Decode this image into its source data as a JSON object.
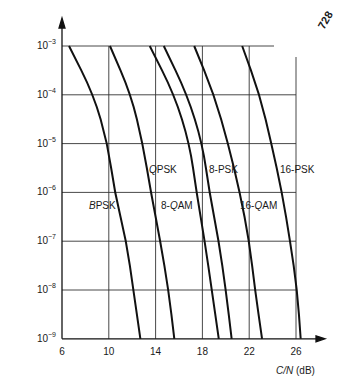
{
  "page_number": "728",
  "chart_data": {
    "type": "line",
    "title": "",
    "xlabel": "C/N (dB)",
    "ylabel": "Probability of error,  theoretical bit error rate",
    "x_scale": "linear",
    "y_scale": "log",
    "xlim": [
      6,
      28
    ],
    "ylim": [
      1e-09,
      0.001
    ],
    "x_ticks": [
      "6",
      "10",
      "14",
      "18",
      "22",
      "26"
    ],
    "y_ticks": [
      "10^-3",
      "10^-4",
      "10^-5",
      "10^-6",
      "10^-7",
      "10^-8",
      "10^-9"
    ],
    "grid": true,
    "legend": "inline labels",
    "y_points": [
      0.001,
      0.0001,
      1e-05,
      1e-06,
      1e-07,
      1e-08,
      1e-09
    ],
    "series": [
      {
        "name": "BPSK",
        "x": [
          6.6,
          8.7,
          9.9,
          10.5,
          11.5,
          12.1,
          12.7
        ]
      },
      {
        "name": "QPSK",
        "x": [
          10.1,
          11.9,
          12.9,
          13.6,
          14.4,
          15.1,
          15.6
        ]
      },
      {
        "name": "8-QAM",
        "x": [
          13.5,
          15.6,
          16.9,
          17.5,
          18.2,
          18.8,
          19.4
        ]
      },
      {
        "name": "8-PSK",
        "x": [
          14.7,
          16.7,
          18.0,
          18.6,
          19.4,
          20.0,
          20.5
        ]
      },
      {
        "name": "16-QAM",
        "x": [
          17.3,
          19.0,
          20.2,
          21.2,
          22.0,
          22.5,
          23.1
        ]
      },
      {
        "name": "16-PSK",
        "x": [
          21.4,
          22.9,
          23.9,
          24.8,
          25.5,
          26.1,
          26.4
        ]
      }
    ]
  },
  "labels": {
    "ylabel": "Probability of error,  theoretical bit error rate",
    "xlabel_var": "C/N",
    "xlabel_unit": " (dB)",
    "yticks": [
      {
        "base": "10",
        "exp": "−3"
      },
      {
        "base": "10",
        "exp": "−4"
      },
      {
        "base": "10",
        "exp": "−5"
      },
      {
        "base": "10",
        "exp": "−6"
      },
      {
        "base": "10",
        "exp": "−7"
      },
      {
        "base": "10",
        "exp": "−8"
      },
      {
        "base": "10",
        "exp": "−9"
      }
    ],
    "xticks": [
      "6",
      "10",
      "14",
      "18",
      "22",
      "26"
    ],
    "curves": {
      "bpsk_prefix": "B",
      "bpsk_rest": "PSK",
      "qpsk_prefix": "Q",
      "qpsk_rest": "PSK",
      "qam8_pre": "8-",
      "qam8_q": "Q",
      "qam8_rest": "AM",
      "psk8": "8-PSK",
      "qam16_pre": "16-",
      "qam16_q": "Q",
      "qam16_rest": "AM",
      "psk16": "16-PSK"
    }
  }
}
